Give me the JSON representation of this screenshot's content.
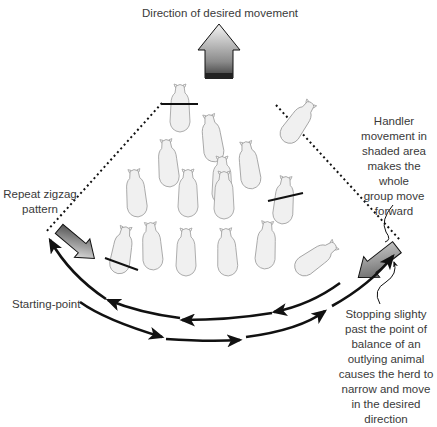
{
  "title": "Direction of desired movement",
  "labels": {
    "handler_movement": "Handler movement in shaded area makes the whole group move forward",
    "handler_movement_lines": [
      "Handler",
      "movement in",
      "shaded area",
      "makes the whole",
      "group move",
      "forward"
    ],
    "repeat_zigzag_lines": [
      "Repeat zigzag",
      "pattern"
    ],
    "starting_point": "Starting-point",
    "stopping_lines": [
      "Stopping slighty",
      "past the point of",
      "balance of an",
      "outlying animal",
      "causes the herd to",
      "narrow and move",
      "in the desired",
      "direction"
    ]
  },
  "elements": {
    "top_arrow": "large shaded arrow pointing up (direction of desired movement)",
    "left_handler_arrow": "shaded arrow pointing down-right (handler approach from left)",
    "right_handler_arrow": "shaded arrow pointing down-left (handler approach from right)",
    "flight_zone": "dotted lines forming boundary of shaded area",
    "balance_lines": "solid lines across outlying animals indicating point of balance",
    "zigzag_path": "curved arrows showing handler zigzag path"
  },
  "animal_count": 15,
  "colors": {
    "arrow_dark": "#1a1a1a",
    "arrow_light": "#e8e8e8",
    "animal_fill": "#f0f0f0",
    "animal_stroke": "#9a9a9a",
    "line": "#111111"
  }
}
